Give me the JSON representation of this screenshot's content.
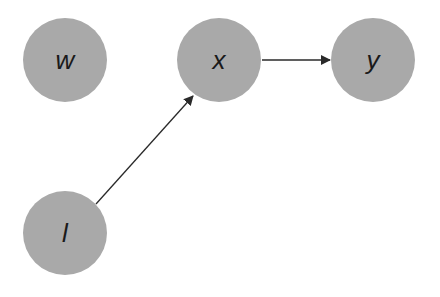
{
  "diagram": {
    "type": "directed-graph",
    "colors": {
      "node_fill": "#a9a9a9",
      "edge": "#2a2a2a",
      "label": "#1a1a1a",
      "background": "#ffffff"
    },
    "nodes": [
      {
        "id": "w",
        "label": "w",
        "cx": 65,
        "cy": 60,
        "r": 42
      },
      {
        "id": "x",
        "label": "x",
        "cx": 219,
        "cy": 60,
        "r": 42
      },
      {
        "id": "y",
        "label": "y",
        "cx": 373,
        "cy": 60,
        "r": 42
      },
      {
        "id": "l",
        "label": "l",
        "cx": 65,
        "cy": 233,
        "r": 42
      }
    ],
    "edges": [
      {
        "from": "x",
        "to": "y"
      },
      {
        "from": "l",
        "to": "x"
      }
    ]
  }
}
